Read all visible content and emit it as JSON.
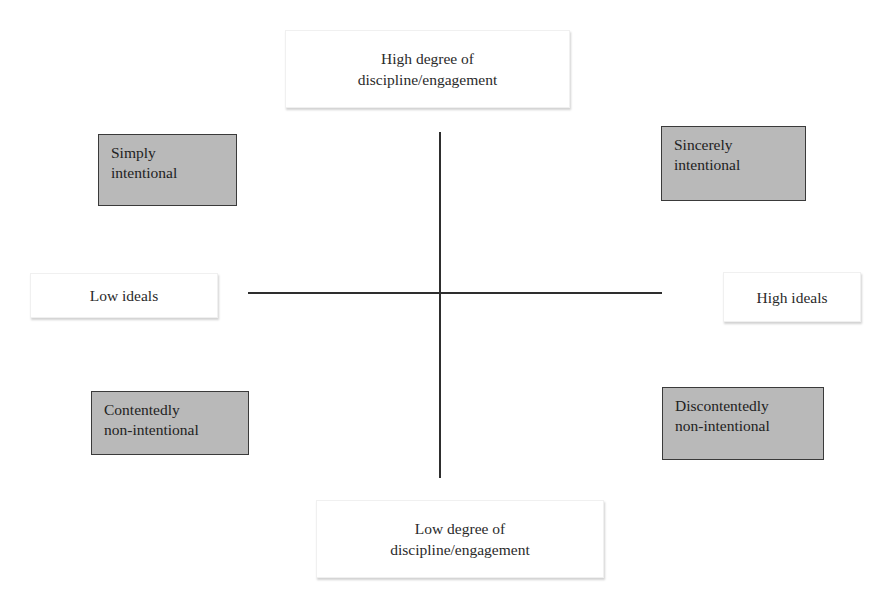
{
  "diagram": {
    "type": "quadrant",
    "axes": {
      "vertical": {
        "top_label": [
          "High degree of",
          "discipline/engagement"
        ],
        "bottom_label": [
          "Low degree of",
          "discipline/engagement"
        ]
      },
      "horizontal": {
        "left_label": "Low ideals",
        "right_label": "High ideals"
      }
    },
    "quadrants": {
      "top_left": [
        "Simply",
        "intentional"
      ],
      "top_right": [
        "Sincerely",
        "intentional"
      ],
      "bottom_left": [
        "Contentedly",
        "non-intentional"
      ],
      "bottom_right": [
        "Discontentedly",
        "non-intentional"
      ]
    },
    "colors": {
      "quadrant_fill": "#b9b9b9",
      "quadrant_border": "#3a3a3a",
      "axis_line": "#2e2e2e",
      "label_fill": "#ffffff"
    }
  }
}
